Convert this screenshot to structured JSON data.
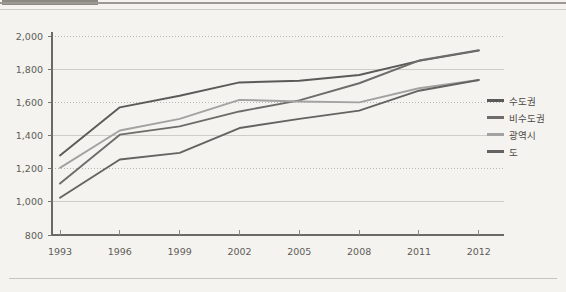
{
  "chart_data": {
    "type": "line",
    "title": "",
    "xlabel": "",
    "ylabel": "",
    "categories": [
      "1993",
      "1996",
      "1999",
      "2002",
      "2005",
      "2008",
      "2011",
      "2012"
    ],
    "ylim": [
      800,
      2000
    ],
    "yticks": [
      "800",
      "1,000",
      "1,200",
      "1,400",
      "1,600",
      "1,800",
      "2,000"
    ],
    "ytick_values": [
      800,
      1000,
      1200,
      1400,
      1600,
      1800,
      2000
    ],
    "grid": true,
    "legend_position": "right",
    "series": [
      {
        "name": "수도권",
        "color": "#5b5a58",
        "values": [
          1280,
          1570,
          1640,
          1720,
          1730,
          1765,
          1850,
          1912
        ]
      },
      {
        "name": "비수도권",
        "color": "#6d6c6a",
        "values": [
          1110,
          1405,
          1455,
          1545,
          1612,
          1715,
          1852,
          1915
        ]
      },
      {
        "name": "광역시",
        "color": "#a3a2a0",
        "values": [
          1205,
          1430,
          1500,
          1615,
          1605,
          1600,
          1685,
          1735
        ]
      },
      {
        "name": "도",
        "color": "#646361",
        "values": [
          1025,
          1255,
          1295,
          1445,
          1500,
          1550,
          1670,
          1735
        ]
      }
    ]
  },
  "legend": {
    "items": [
      {
        "label": "수도권"
      },
      {
        "label": "비수도권"
      },
      {
        "label": "광역시"
      },
      {
        "label": "도"
      }
    ]
  }
}
